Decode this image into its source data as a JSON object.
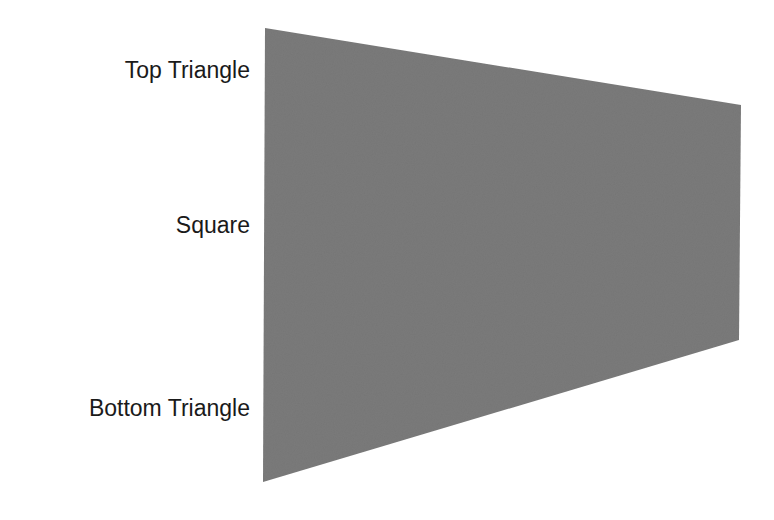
{
  "labels": {
    "top": "Top Triangle",
    "middle": "Square",
    "bottom": "Bottom Triangle"
  },
  "shape": {
    "type": "trapezoid",
    "fill": "#7b7b7b",
    "points": "265,28 741,105 739,340 263,482"
  }
}
